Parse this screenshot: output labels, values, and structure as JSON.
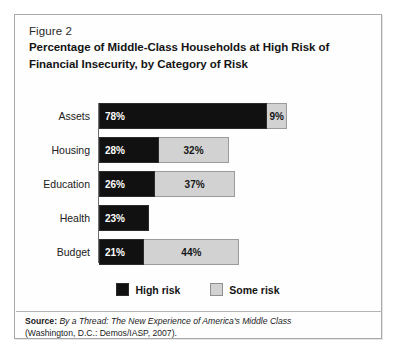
{
  "figure": {
    "number": "Figure 2",
    "title_line1": "Percentage of Middle-Class Households at High Risk of",
    "title_line2": "Financial Insecurity, by Category of Risk"
  },
  "legend": {
    "high_label": "High risk",
    "some_label": "Some risk"
  },
  "source": {
    "label": "Source:",
    "title": "By a Thread: The New Experience of America's Middle Class",
    "publication": "(Washington, D.C.: Demos/IASP, 2007)."
  },
  "colors": {
    "high_risk": "#111111",
    "some_risk": "#d2d2d2",
    "border": "#a8a8a8",
    "background": "#fefefe"
  },
  "chart_data": {
    "type": "bar",
    "orientation": "horizontal",
    "stacked": true,
    "title": "Percentage of Middle-Class Households at High Risk of Financial Insecurity, by Category of Risk",
    "xlabel": "",
    "ylabel": "",
    "xlim": [
      0,
      90
    ],
    "grid": false,
    "legend_position": "bottom-center",
    "categories": [
      "Assets",
      "Housing",
      "Education",
      "Health",
      "Budget"
    ],
    "series": [
      {
        "name": "High risk",
        "color": "#111111",
        "values": [
          78,
          28,
          26,
          23,
          21
        ],
        "labels": [
          "78%",
          "28%",
          "26%",
          "23%",
          "21%"
        ]
      },
      {
        "name": "Some risk",
        "color": "#d2d2d2",
        "values": [
          9,
          32,
          37,
          0,
          44
        ],
        "labels": [
          "9%",
          "32%",
          "37%",
          "",
          "44%"
        ]
      }
    ],
    "rows": [
      {
        "category": "Assets",
        "high": 78,
        "high_label": "78%",
        "some": 9,
        "some_label": "9%",
        "total": 87
      },
      {
        "category": "Housing",
        "high": 28,
        "high_label": "28%",
        "some": 32,
        "some_label": "32%",
        "total": 60
      },
      {
        "category": "Education",
        "high": 26,
        "high_label": "26%",
        "some": 37,
        "some_label": "37%",
        "total": 63
      },
      {
        "category": "Health",
        "high": 23,
        "high_label": "23%",
        "some": 0,
        "some_label": "",
        "total": 23
      },
      {
        "category": "Budget",
        "high": 21,
        "high_label": "21%",
        "some": 44,
        "some_label": "44%",
        "total": 65
      }
    ]
  }
}
